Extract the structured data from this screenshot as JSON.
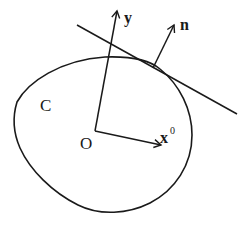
{
  "diagram": {
    "type": "geometry",
    "stroke_color": "#1a1a1a",
    "background": "#ffffff",
    "curve": {
      "label": "C"
    },
    "origin": {
      "label": "O"
    },
    "vectors": [
      {
        "id": "y",
        "label": "y",
        "superscript": ""
      },
      {
        "id": "x0",
        "label": "x",
        "superscript": "0"
      },
      {
        "id": "n",
        "label": "n",
        "superscript": ""
      }
    ],
    "tangent_line": {
      "label": ""
    }
  }
}
